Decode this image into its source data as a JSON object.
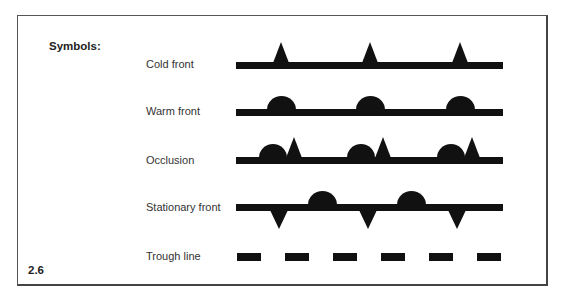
{
  "figure": {
    "heading": "Symbols:",
    "number": "2.6",
    "ink_color": "#111111",
    "border_color": "#444444"
  },
  "legend": [
    {
      "label": "Cold front",
      "symbol": "line-with-triangles-up",
      "label_top": 58
    },
    {
      "label": "Warm front",
      "symbol": "line-with-semicircles-up",
      "label_top": 105
    },
    {
      "label": "Occlusion",
      "symbol": "line-with-semicircle-triangle-pairs",
      "label_top": 154
    },
    {
      "label": "Stationary front",
      "symbol": "line-with-alternating-triangles-down-semicircles-up",
      "label_top": 201
    },
    {
      "label": "Trough line",
      "symbol": "dashed-line",
      "label_top": 250
    }
  ]
}
